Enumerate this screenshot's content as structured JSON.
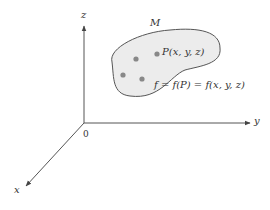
{
  "diagram": {
    "axes": {
      "z_label": "z",
      "y_label": "y",
      "x_label": "x",
      "origin_label": "0"
    },
    "region": {
      "label": "M",
      "fill": "#ececec",
      "stroke": "#555555",
      "points": [
        {
          "label": "P(x, y, z)",
          "cx": 157,
          "cy": 54
        },
        {
          "label": "",
          "cx": 136,
          "cy": 59
        },
        {
          "label": "",
          "cx": 123,
          "cy": 75
        },
        {
          "label": "",
          "cx": 142,
          "cy": 79
        }
      ],
      "point_color": "#888888"
    },
    "equation": "f = f(P) = f(x, y, z)",
    "colors": {
      "axis": "#555555",
      "text": "#333333"
    }
  }
}
